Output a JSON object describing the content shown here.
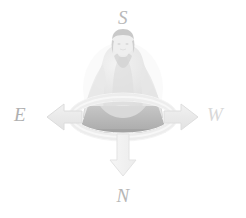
{
  "figure": {
    "background_color": "#ffffff",
    "subject": {
      "name": "seated-meditating-person",
      "description": "faded photographic cutout of a person seated cross-legged in meditation on a cushion",
      "robe_color": "#e2e2e2",
      "hair_color": "#c9c9c9",
      "skin_color": "#ededed",
      "cushion_color": "#b8b8b8"
    },
    "ring": {
      "name": "orientation-ellipse",
      "stroke_color": "#ededed",
      "center_x": 123,
      "center_y": 117,
      "radius_x": 51,
      "radius_y": 20
    },
    "arrows": [
      {
        "direction": "west",
        "points_to": "left",
        "label": "E",
        "fill_color": "#e8e8e8",
        "stroke_color": "#dcdcdc"
      },
      {
        "direction": "east",
        "points_to": "right",
        "label": "W",
        "fill_color": "#ebebeb",
        "stroke_color": "#dedede"
      },
      {
        "direction": "south",
        "points_to": "down",
        "label": "N",
        "fill_color": "#f2f2f2",
        "stroke_color": "#e3e3e3"
      }
    ],
    "labels": {
      "top": "S",
      "bottom": "N",
      "left": "E",
      "right": "W"
    },
    "label_colors": {
      "top": "#b9b9b9",
      "bottom": "#b6b6b6",
      "left": "#b0b0b0",
      "right": "#d8d8d8"
    }
  }
}
